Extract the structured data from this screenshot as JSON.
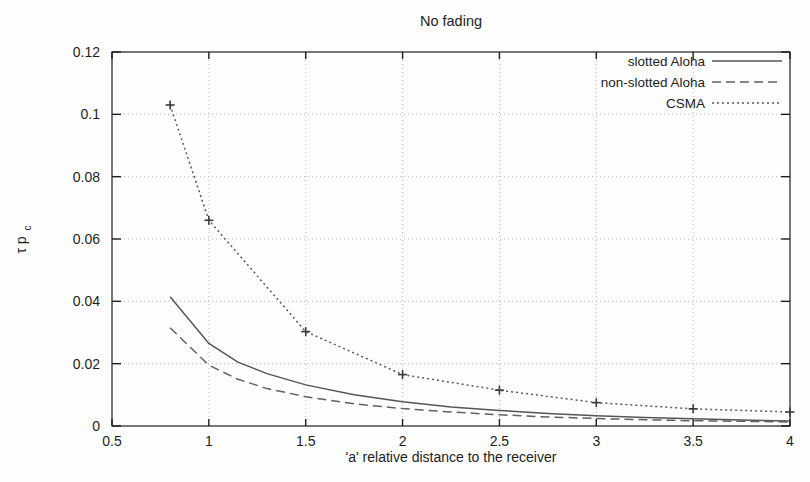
{
  "chart_data": {
    "type": "line",
    "title": "No fading",
    "xlabel": "'a' relative distance to the receiver",
    "ylabel": "τ p",
    "ylabel_sub": "c",
    "xlim": [
      0.5,
      4
    ],
    "ylim": [
      0,
      0.12
    ],
    "xticks": [
      0.5,
      1,
      1.5,
      2,
      2.5,
      3,
      3.5,
      4
    ],
    "xtick_labels": [
      "0.5",
      "1",
      "1.5",
      "2",
      "2.5",
      "3",
      "3.5",
      "4"
    ],
    "yticks": [
      0,
      0.02,
      0.04,
      0.06,
      0.08,
      0.1,
      0.12
    ],
    "ytick_labels": [
      "0",
      "0.02",
      "0.04",
      "0.06",
      "0.08",
      "0.1",
      "0.12"
    ],
    "grid": true,
    "grid_style": "dotted",
    "legend_position": "top-right",
    "series": [
      {
        "name": "slotted Aloha",
        "style": "solid",
        "color": "#555555",
        "marker": "none",
        "x": [
          0.8,
          1.0,
          1.15,
          1.3,
          1.5,
          1.75,
          2.0,
          2.25,
          2.5,
          2.75,
          3.0,
          3.25,
          3.5,
          3.75,
          4.0
        ],
        "y": [
          0.0415,
          0.0265,
          0.0205,
          0.0168,
          0.0132,
          0.01,
          0.0078,
          0.0061,
          0.005,
          0.004,
          0.0033,
          0.0027,
          0.0023,
          0.0019,
          0.0016
        ]
      },
      {
        "name": "non-slotted Aloha",
        "style": "dashed",
        "color": "#606060",
        "marker": "none",
        "x": [
          0.8,
          1.0,
          1.15,
          1.3,
          1.5,
          1.75,
          2.0,
          2.25,
          2.5,
          2.75,
          3.0,
          3.25,
          3.5,
          3.75,
          4.0
        ],
        "y": [
          0.0315,
          0.0195,
          0.015,
          0.012,
          0.0094,
          0.0071,
          0.0056,
          0.0045,
          0.0036,
          0.0029,
          0.0024,
          0.002,
          0.0017,
          0.0015,
          0.0013
        ]
      },
      {
        "name": "CSMA",
        "style": "dotted",
        "color": "#5a5a5a",
        "marker": "plus",
        "x": [
          0.8,
          1.0,
          1.5,
          2.0,
          2.5,
          3.0,
          3.5,
          4.0
        ],
        "y": [
          0.103,
          0.066,
          0.0303,
          0.0165,
          0.0115,
          0.0075,
          0.0055,
          0.0045
        ]
      }
    ]
  },
  "legend": {
    "entries": [
      {
        "label": "slotted Aloha",
        "style": "solid"
      },
      {
        "label": "non-slotted Aloha",
        "style": "dashed"
      },
      {
        "label": "CSMA",
        "style": "dotted"
      }
    ]
  },
  "colors": {
    "axis": "#1d1d1d",
    "grid": "#b8b8b8",
    "plot_bg": "#fefefe",
    "text": "#1d1d1d"
  }
}
